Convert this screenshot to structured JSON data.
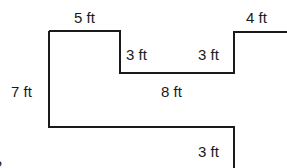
{
  "diagram": {
    "labels": {
      "top_left": "5 ft",
      "top_right": "4 ft",
      "notch_left": "3 ft",
      "notch_right": "3 ft",
      "left": "7 ft",
      "middle": "8 ft",
      "bottom_right": "3 ft",
      "corner_fragment": "2"
    },
    "stroke_color": "#1a1a1a"
  }
}
